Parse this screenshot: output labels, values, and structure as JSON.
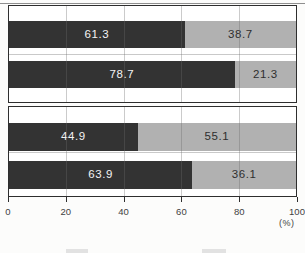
{
  "chart_data": {
    "type": "bar",
    "orientation": "horizontal",
    "stacked": true,
    "title": "",
    "xlabel": "",
    "unit_label": "(%)",
    "xlim": [
      0,
      100
    ],
    "x_ticks": [
      0,
      20,
      40,
      60,
      80,
      100
    ],
    "gridlines_percent": [
      20,
      40,
      60,
      80
    ],
    "grid": true,
    "colors": {
      "dark_segment": "#333333",
      "light_segment": "#b1b1b1"
    },
    "panels": [
      {
        "name": "top-panel",
        "rows": [
          {
            "dark": 61.3,
            "light": 38.7
          },
          {
            "dark": 78.7,
            "light": 21.3
          }
        ]
      },
      {
        "name": "bottom-panel",
        "rows": [
          {
            "dark": 44.9,
            "light": 55.1
          },
          {
            "dark": 63.9,
            "light": 36.1
          }
        ]
      }
    ],
    "legend": {
      "position": "bottom",
      "partially_cut_off": true,
      "labels": []
    }
  }
}
